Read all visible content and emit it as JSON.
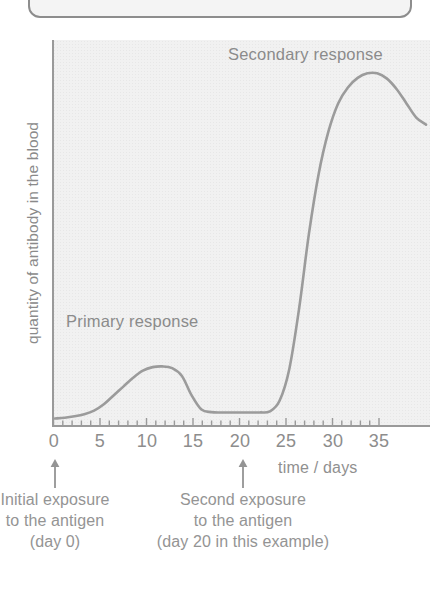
{
  "chart_data": {
    "type": "line",
    "title": "",
    "xlabel": "time / days",
    "ylabel": "quantity of antibody in the blood",
    "xlim": [
      0,
      38
    ],
    "ylim": [
      0,
      1
    ],
    "grid": false,
    "legend_position": "none",
    "xticks": [
      "0",
      "5",
      "10",
      "15",
      "20",
      "25",
      "30",
      "35"
    ],
    "xtick_values": [
      0,
      5,
      10,
      15,
      20,
      25,
      30,
      35
    ],
    "minor_tick_interval": 1,
    "yticks": [],
    "series": [
      {
        "name": "antibody level",
        "color": "#9b9b9b",
        "x": [
          0,
          1,
          2,
          3,
          4,
          5,
          6,
          7,
          8,
          9,
          10,
          11,
          12,
          13,
          14,
          15,
          16,
          17,
          18,
          19,
          20,
          21,
          22,
          23,
          24,
          25,
          26,
          27,
          28,
          29,
          30,
          31,
          32,
          33,
          34,
          35,
          36,
          37,
          38
        ],
        "y": [
          0.01,
          0.012,
          0.016,
          0.022,
          0.032,
          0.05,
          0.075,
          0.1,
          0.125,
          0.145,
          0.155,
          0.157,
          0.152,
          0.13,
          0.075,
          0.035,
          0.028,
          0.027,
          0.027,
          0.027,
          0.027,
          0.027,
          0.03,
          0.06,
          0.15,
          0.32,
          0.53,
          0.7,
          0.82,
          0.9,
          0.945,
          0.972,
          0.985,
          0.985,
          0.97,
          0.94,
          0.9,
          0.86,
          0.84
        ]
      }
    ],
    "annotations": [
      {
        "name": "secondary-response",
        "text": "Secondary response",
        "x": 31,
        "y": 0.99
      },
      {
        "name": "primary-response",
        "text": "Primary response",
        "x": 3,
        "y": 0.31
      },
      {
        "name": "initial-exposure",
        "text": "Initial exposure to the antigen (day 0)",
        "x": 0,
        "y": 0,
        "arrow": "up"
      },
      {
        "name": "second-exposure",
        "text": "Second exposure to the antigen (day 20 in this example)",
        "x": 20,
        "y": 0,
        "arrow": "up"
      }
    ]
  },
  "axes": {
    "y_label": "quantity of antibody in the blood",
    "x_title": "time / days",
    "x_tick_labels": [
      "0",
      "5",
      "10",
      "15",
      "20",
      "25",
      "30",
      "35"
    ]
  },
  "labels": {
    "secondary_response": "Secondary response",
    "primary_response": "Primary response"
  },
  "callouts": {
    "initial": {
      "line1": "Initial exposure",
      "line2": "to the antigen",
      "line3": "(day 0)"
    },
    "second": {
      "line1": "Second exposure",
      "line2": "to the antigen",
      "line3": "(day 20 in this example)"
    }
  },
  "colors": {
    "curve": "#9b9b9b",
    "axis": "#9a9a9a",
    "text": "#8d8d8d",
    "plot_background": "#f1f1f1",
    "page_background": "#ffffff",
    "box_border": "#8d8d8d"
  }
}
